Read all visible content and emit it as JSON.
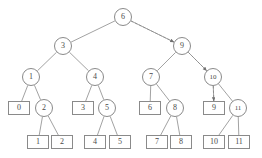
{
  "figure": {
    "type": "binary-tree-diagram",
    "stroke_color": "#8a8a8a",
    "text_color": "#4a4a4a",
    "background_color": "#ffffff",
    "dashed_arrow_color": "#8a8a8a"
  },
  "nodes": [
    {
      "id": "n0",
      "label": "6",
      "shape": "circle",
      "x": 123,
      "y": 17,
      "level": 0
    },
    {
      "id": "n1",
      "label": "3",
      "shape": "circle",
      "x": 63,
      "y": 46,
      "level": 1
    },
    {
      "id": "n2",
      "label": "9",
      "shape": "circle",
      "x": 182,
      "y": 46,
      "level": 1
    },
    {
      "id": "n3",
      "label": "1",
      "shape": "circle",
      "x": 31,
      "y": 77,
      "level": 2
    },
    {
      "id": "n4",
      "label": "4",
      "shape": "circle",
      "x": 95,
      "y": 77,
      "level": 2
    },
    {
      "id": "n5",
      "label": "7",
      "shape": "circle",
      "x": 151,
      "y": 77,
      "level": 2
    },
    {
      "id": "n6",
      "label": "10",
      "shape": "circle",
      "x": 213,
      "y": 77,
      "level": 2
    },
    {
      "id": "n7",
      "label": "0",
      "shape": "rect",
      "x": 19,
      "y": 108,
      "level": 3
    },
    {
      "id": "n8",
      "label": "2",
      "shape": "circle",
      "x": 44,
      "y": 108,
      "level": 3
    },
    {
      "id": "n9",
      "label": "3",
      "shape": "rect",
      "x": 83,
      "y": 108,
      "level": 3
    },
    {
      "id": "n10",
      "label": "5",
      "shape": "circle",
      "x": 107,
      "y": 108,
      "level": 3
    },
    {
      "id": "n11",
      "label": "6",
      "shape": "rect",
      "x": 150,
      "y": 108,
      "level": 3
    },
    {
      "id": "n12",
      "label": "8",
      "shape": "circle",
      "x": 175,
      "y": 108,
      "level": 3
    },
    {
      "id": "n13",
      "label": "9",
      "shape": "rect",
      "x": 214,
      "y": 108,
      "level": 3
    },
    {
      "id": "n14",
      "label": "11",
      "shape": "circle",
      "x": 238,
      "y": 108,
      "level": 3
    },
    {
      "id": "n15",
      "label": "1",
      "shape": "rect",
      "x": 38,
      "y": 142,
      "level": 4
    },
    {
      "id": "n16",
      "label": "2",
      "shape": "rect",
      "x": 62,
      "y": 142,
      "level": 4
    },
    {
      "id": "n17",
      "label": "4",
      "shape": "rect",
      "x": 95,
      "y": 142,
      "level": 4
    },
    {
      "id": "n18",
      "label": "5",
      "shape": "rect",
      "x": 120,
      "y": 142,
      "level": 4
    },
    {
      "id": "n19",
      "label": "7",
      "shape": "rect",
      "x": 157,
      "y": 142,
      "level": 4
    },
    {
      "id": "n20",
      "label": "8",
      "shape": "rect",
      "x": 181,
      "y": 142,
      "level": 4
    },
    {
      "id": "n21",
      "label": "10",
      "shape": "rect",
      "x": 214,
      "y": 142,
      "level": 4
    },
    {
      "id": "n22",
      "label": "11",
      "shape": "rect",
      "x": 239,
      "y": 142,
      "level": 4
    }
  ],
  "edges": [
    {
      "from": "n0",
      "to": "n1"
    },
    {
      "from": "n0",
      "to": "n2"
    },
    {
      "from": "n1",
      "to": "n3"
    },
    {
      "from": "n1",
      "to": "n4"
    },
    {
      "from": "n2",
      "to": "n5"
    },
    {
      "from": "n2",
      "to": "n6"
    },
    {
      "from": "n3",
      "to": "n7"
    },
    {
      "from": "n3",
      "to": "n8"
    },
    {
      "from": "n4",
      "to": "n9"
    },
    {
      "from": "n4",
      "to": "n10"
    },
    {
      "from": "n5",
      "to": "n11"
    },
    {
      "from": "n5",
      "to": "n12"
    },
    {
      "from": "n6",
      "to": "n13"
    },
    {
      "from": "n6",
      "to": "n14"
    },
    {
      "from": "n8",
      "to": "n15"
    },
    {
      "from": "n8",
      "to": "n16"
    },
    {
      "from": "n10",
      "to": "n17"
    },
    {
      "from": "n10",
      "to": "n18"
    },
    {
      "from": "n12",
      "to": "n19"
    },
    {
      "from": "n12",
      "to": "n20"
    },
    {
      "from": "n14",
      "to": "n21"
    },
    {
      "from": "n14",
      "to": "n22"
    }
  ],
  "traversal_arrows": [
    {
      "id": "a1",
      "from": "n0",
      "to": "n2",
      "style": "dashed"
    },
    {
      "id": "a2",
      "from": "n2",
      "to": "n6",
      "style": "dashed"
    },
    {
      "id": "a3",
      "from": "n6",
      "to": "n13",
      "style": "dashed"
    }
  ]
}
